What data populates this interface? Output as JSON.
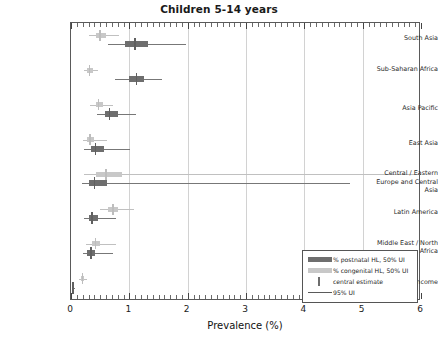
{
  "chart_data": {
    "type": "bar",
    "subtype": "horizontal-box-whisker",
    "title": "Children 5-14 years",
    "xlabel": "Prevalence (%)",
    "ylabel": "",
    "xlim": [
      0,
      6
    ],
    "xticks": [
      0,
      1,
      2,
      3,
      4,
      5,
      6
    ],
    "xticklabels": [
      "0",
      "1",
      "2",
      "3",
      "4",
      "5",
      "6"
    ],
    "grid": "vertical",
    "legend_position": "lower right",
    "categories": [
      "South Asia",
      "Sub-Saharan Africa",
      "Asia Pacific",
      "East Asia",
      "Central / Eastern Europe and Central Asia",
      "Latin America",
      "Middle East / North Africa",
      "High-income"
    ],
    "series": [
      {
        "name": "% congenital HL, 50% UI",
        "color": "#c8c8c8",
        "points": [
          {
            "category": "South Asia",
            "central": 0.5,
            "ui50": [
              0.42,
              0.6
            ],
            "ui95": [
              0.3,
              0.82
            ]
          },
          {
            "category": "Sub-Saharan Africa",
            "central": 0.32,
            "ui50": [
              0.28,
              0.37
            ],
            "ui95": [
              0.22,
              0.46
            ]
          },
          {
            "category": "Asia Pacific",
            "central": 0.47,
            "ui50": [
              0.42,
              0.55
            ],
            "ui95": [
              0.33,
              0.72
            ]
          },
          {
            "category": "East Asia",
            "central": 0.33,
            "ui50": [
              0.28,
              0.4
            ],
            "ui95": [
              0.2,
              0.62
            ]
          },
          {
            "category": "Central / Eastern Europe and Central Asia",
            "central": 0.6,
            "ui50": [
              0.42,
              0.88
            ],
            "ui95": [
              0.22,
              6.0
            ]
          },
          {
            "category": "Latin America",
            "central": 0.72,
            "ui50": [
              0.64,
              0.8
            ],
            "ui95": [
              0.5,
              1.08
            ]
          },
          {
            "category": "Middle East / North Africa",
            "central": 0.42,
            "ui50": [
              0.36,
              0.5
            ],
            "ui95": [
              0.26,
              0.78
            ]
          },
          {
            "category": "High-income",
            "central": 0.2,
            "ui50": [
              0.17,
              0.23
            ],
            "ui95": [
              0.13,
              0.28
            ]
          }
        ]
      },
      {
        "name": "% postnatal HL, 50% UI",
        "color": "#6e6e6e",
        "points": [
          {
            "category": "South Asia",
            "central": 1.1,
            "ui50": [
              0.92,
              1.32
            ],
            "ui95": [
              0.64,
              1.98
            ]
          },
          {
            "category": "Sub-Saharan Africa",
            "central": 1.12,
            "ui50": [
              1.0,
              1.26
            ],
            "ui95": [
              0.76,
              1.56
            ]
          },
          {
            "category": "Asia Pacific",
            "central": 0.66,
            "ui50": [
              0.58,
              0.8
            ],
            "ui95": [
              0.45,
              1.12
            ]
          },
          {
            "category": "East Asia",
            "central": 0.42,
            "ui50": [
              0.34,
              0.56
            ],
            "ui95": [
              0.22,
              1.02
            ]
          },
          {
            "category": "Central / Eastern Europe and Central Asia",
            "central": 0.4,
            "ui50": [
              0.3,
              0.62
            ],
            "ui95": [
              0.18,
              4.78
            ]
          },
          {
            "category": "Latin America",
            "central": 0.36,
            "ui50": [
              0.3,
              0.46
            ],
            "ui95": [
              0.22,
              0.78
            ]
          },
          {
            "category": "Middle East / North Africa",
            "central": 0.34,
            "ui50": [
              0.28,
              0.42
            ],
            "ui95": [
              0.2,
              0.72
            ]
          },
          {
            "category": "High-income",
            "central": 0.03,
            "ui50": [
              0.02,
              0.05
            ],
            "ui95": [
              0.01,
              0.07
            ]
          }
        ]
      }
    ],
    "legend": [
      {
        "label": "% postnatal HL, 50% UI",
        "key": "swatch-dark",
        "color": "#6e6e6e"
      },
      {
        "label": "% congenital HL, 50% UI",
        "key": "swatch-light",
        "color": "#c8c8c8"
      },
      {
        "label": "central estimate",
        "key": "vertical-bar",
        "color": "#6d6d6d"
      },
      {
        "label": "95% UI",
        "key": "horizontal-line",
        "color": "#5a5a5a"
      }
    ]
  }
}
